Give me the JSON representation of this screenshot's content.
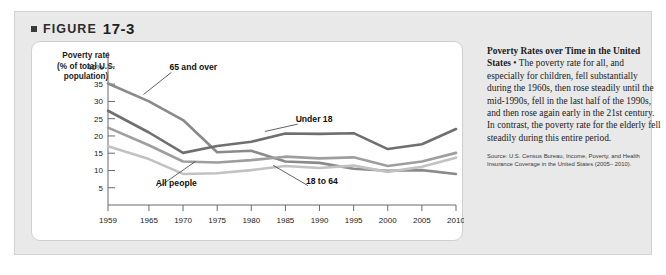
{
  "figure": {
    "bullet_icon": "square-bullet-icon",
    "label": "FIGURE",
    "number": "17-3"
  },
  "caption": {
    "title": "Poverty Rates over Time in the United States",
    "separator": " • ",
    "body": "The poverty rate for all, and especially for children, fell substantially during the 1960s, then rose steadily until the mid-1990s, fell in the last half of the 1990s, and then rose again early in the 21st century. In contrast, the poverty rate for the elderly fell steadily during this entire period.",
    "source": "Source: U.S. Census Bureau, Income, Poverty, and Health Insurance Coverage in the United States (2005– 2010)."
  },
  "chart_data": {
    "type": "line",
    "title": "",
    "ylabel": "Poverty rate (% of total U.S. population)",
    "ylabel_lines": [
      "Poverty rate",
      "(% of total U.S.",
      "population)"
    ],
    "xlabel": "",
    "grid": false,
    "legend": "inline-labels",
    "xlim": [
      1959,
      2010
    ],
    "ylim": [
      0,
      42
    ],
    "yticks": [
      5,
      10,
      15,
      20,
      25,
      30,
      35,
      40
    ],
    "ytick_labels": [
      "5",
      "10",
      "15",
      "20",
      "25",
      "30",
      "35",
      "40%"
    ],
    "xticks": [
      1959,
      1965,
      1970,
      1975,
      1980,
      1985,
      1990,
      1995,
      2000,
      2005,
      2010
    ],
    "xtick_labels": [
      "1959",
      "1965",
      "1970",
      "1975",
      "1980",
      "1985",
      "1990",
      "1995",
      "2000",
      "2005",
      "2010"
    ],
    "x": [
      1959,
      1965,
      1970,
      1975,
      1980,
      1985,
      1990,
      1995,
      2000,
      2005,
      2010
    ],
    "series": [
      {
        "name": "65 and over",
        "color": "#8a8a8a",
        "label_x": 1968,
        "label_y": 39,
        "leader_to_x": 1964.2,
        "leader_to_y": 32.0,
        "values": [
          35.2,
          30.0,
          24.6,
          15.3,
          15.7,
          12.6,
          12.2,
          10.5,
          9.9,
          10.1,
          9.0
        ]
      },
      {
        "name": "Under 18",
        "color": "#6f6f6f",
        "label_x": 1986.5,
        "label_y": 24.0,
        "leader_to_x": 1982.0,
        "leader_to_y": 21.3,
        "values": [
          27.3,
          21.0,
          15.1,
          17.1,
          18.3,
          20.7,
          20.6,
          20.8,
          16.2,
          17.6,
          22.0
        ]
      },
      {
        "name": "All people",
        "color": "#9e9e9e",
        "label_x": 1966.0,
        "label_y": 5.6,
        "leader_to_x": 1971.8,
        "leader_to_y": 12.6,
        "values": [
          22.4,
          17.3,
          12.6,
          12.3,
          13.0,
          14.0,
          13.5,
          13.8,
          11.3,
          12.6,
          15.1
        ]
      },
      {
        "name": "18 to 64",
        "color": "#c2c2c2",
        "label_x": 1988.0,
        "label_y": 6.2,
        "leader_to_x": 1983.2,
        "leader_to_y": 11.5,
        "values": [
          17.0,
          13.3,
          9.0,
          9.2,
          10.1,
          11.3,
          10.7,
          11.4,
          9.6,
          11.1,
          13.7
        ]
      }
    ]
  }
}
